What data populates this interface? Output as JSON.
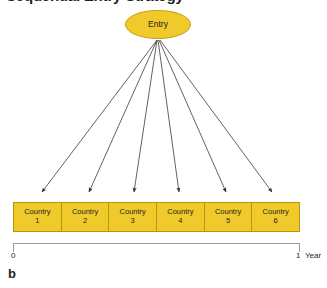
{
  "figure": {
    "title": "Sequential Entry Strategy",
    "panel_letter": "b",
    "accent_fill": "#f0c92b",
    "accent_border": "#b8940f",
    "axis_color": "#9a9a9a",
    "text_color": "#231f20"
  },
  "entry_node": {
    "label": "Entry",
    "shape": "ellipse"
  },
  "arrows": {
    "count": 6,
    "source_label": "Entry",
    "targets": [
      "Country 1",
      "Country 2",
      "Country 3",
      "Country 4",
      "Country 5",
      "Country 6"
    ]
  },
  "countries": [
    {
      "name": "Country",
      "number": "1"
    },
    {
      "name": "Country",
      "number": "2"
    },
    {
      "name": "Country",
      "number": "3"
    },
    {
      "name": "Country",
      "number": "4"
    },
    {
      "name": "Country",
      "number": "5"
    },
    {
      "name": "Country",
      "number": "6"
    }
  ],
  "timeline": {
    "start": "0",
    "end": "1",
    "unit": "Year"
  }
}
